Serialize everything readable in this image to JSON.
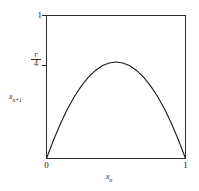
{
  "figure": {
    "background_color": "#ffffff",
    "line_color": "#1c1c1c",
    "frame_color": "#2b2b2b"
  },
  "axes": {
    "xlabel_base": "x",
    "xlabel_sub": "n",
    "ylabel_base": "x",
    "ylabel_sub": "n+1",
    "xticks": [
      "0",
      "1"
    ],
    "yticks": [
      "0",
      "1"
    ],
    "ytick_peak_numerator": "r",
    "ytick_peak_denominator": "4"
  },
  "chart_data": {
    "type": "line",
    "title": "",
    "subtitle": "",
    "xlabel": "x_n",
    "ylabel": "x_{n+1}",
    "xlim": [
      0,
      1
    ],
    "ylim": [
      0,
      1
    ],
    "grid": false,
    "legend": null,
    "xticks": [
      0,
      1
    ],
    "xticklabels": [
      "0",
      "1"
    ],
    "yticks": [
      0,
      0.675,
      1
    ],
    "yticklabels": [
      "0",
      "r/4",
      "1"
    ],
    "annotations": [
      {
        "text": "r/4",
        "x": 0,
        "y": 0.675,
        "note": "peak height tick on y-axis"
      }
    ],
    "series": [
      {
        "name": "logistic map x_{n+1} = r x_n (1 - x_n)",
        "equation": "y = 2.7 * x * (1 - x)",
        "peak_x": 0.5,
        "peak_y": 0.675,
        "x": [
          0.0,
          0.05,
          0.1,
          0.15,
          0.2,
          0.25,
          0.3,
          0.35,
          0.4,
          0.45,
          0.5,
          0.55,
          0.6,
          0.65,
          0.7,
          0.75,
          0.8,
          0.85,
          0.9,
          0.95,
          1.0
        ],
        "values": [
          0.0,
          0.128,
          0.243,
          0.344,
          0.432,
          0.506,
          0.567,
          0.614,
          0.648,
          0.668,
          0.675,
          0.668,
          0.648,
          0.614,
          0.567,
          0.506,
          0.432,
          0.344,
          0.243,
          0.128,
          0.0
        ]
      }
    ]
  }
}
